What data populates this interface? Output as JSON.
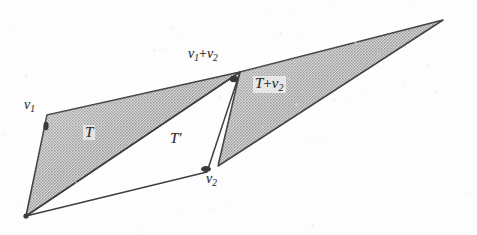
{
  "figure": {
    "background_color": "#fdfdfd",
    "shade_color": "#a9a9a9",
    "line_color": "#3a3a3a"
  },
  "labels": {
    "v1": {
      "base": "v",
      "sub": "1"
    },
    "v2": {
      "base": "v",
      "sub": "2"
    },
    "v1_plus_v2": {
      "base": "v",
      "sub1": "1",
      "operator": "+",
      "base2": "v",
      "sub2": "2"
    },
    "triangle_T": "T",
    "triangle_T_prime": "T′",
    "triangle_T_plus_v2": {
      "base": "T",
      "operator": "+",
      "base2": "v",
      "sub2": "2"
    }
  },
  "geometry": {
    "origin": [
      26,
      216
    ],
    "v1": [
      47,
      115
    ],
    "v1_plus_v2": [
      240,
      72
    ],
    "v2": [
      207,
      172
    ],
    "right_apex": [
      443,
      20
    ],
    "right_lower": [
      218,
      166
    ],
    "triangle_T_points": "26,216 47,115 240,72",
    "triangle_T_prime_points": "26,216 240,72 207,172",
    "triangle_T_plus_v2_points": "240,72 443,20 218,166"
  }
}
